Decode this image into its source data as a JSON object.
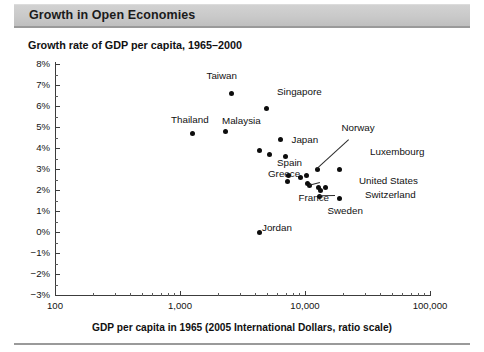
{
  "header": {
    "title": "Growth in Open Economies"
  },
  "chart_data": {
    "type": "scatter",
    "title": "Growth rate of GDP per capita, 1965–2000",
    "xlabel": "GDP per capita in 1965 (2005 International Dollars, ratio scale)",
    "ylabel": "",
    "xscale": "log",
    "xlim": [
      100,
      100000
    ],
    "ylim": [
      -3,
      8
    ],
    "grid": false,
    "legend": null,
    "xticks": [
      "100",
      "1,000",
      "10,000",
      "100,000"
    ],
    "xtick_values": [
      100,
      1000,
      10000,
      100000
    ],
    "yticks": [
      "8%",
      "7%",
      "6%",
      "5%",
      "4%",
      "3%",
      "2%",
      "1%",
      "0%",
      "−1%",
      "−2%",
      "−3%"
    ],
    "ytick_values": [
      8,
      7,
      6,
      5,
      4,
      3,
      2,
      1,
      0,
      -1,
      -2,
      -3
    ],
    "points": [
      {
        "name": "Taiwan",
        "x": 2600,
        "y": 6.6,
        "label": "Taiwan",
        "lx": 222,
        "ly": 76,
        "anchor": "center",
        "leader": false
      },
      {
        "name": "Singapore",
        "x": 4900,
        "y": 5.9,
        "label": "Singapore",
        "lx": 277,
        "ly": 92,
        "anchor": "left",
        "leader": false
      },
      {
        "name": "Thailand",
        "x": 1250,
        "y": 4.7,
        "label": "Thailand",
        "lx": 190,
        "ly": 120,
        "anchor": "center",
        "leader": false
      },
      {
        "name": "Malaysia",
        "x": 2300,
        "y": 4.8,
        "label": "Malaysia",
        "lx": 222,
        "ly": 121,
        "anchor": "left",
        "leader": false
      },
      {
        "name": "Unlabeled-1",
        "x": 6400,
        "y": 4.4,
        "label": "",
        "lx": 0,
        "ly": 0,
        "anchor": "left",
        "leader": false
      },
      {
        "name": "Japan",
        "x": 7000,
        "y": 3.6,
        "label": "Japan",
        "lx": 305,
        "ly": 140,
        "anchor": "center",
        "leader": false
      },
      {
        "name": "Unlabeled-2",
        "x": 4300,
        "y": 3.9,
        "label": "",
        "lx": 0,
        "ly": 0,
        "anchor": "left",
        "leader": false
      },
      {
        "name": "Unlabeled-3",
        "x": 5200,
        "y": 3.7,
        "label": "",
        "lx": 0,
        "ly": 0,
        "anchor": "left",
        "leader": false
      },
      {
        "name": "Norway",
        "x": 12500,
        "y": 3.0,
        "label": "Norway",
        "lx": 358,
        "ly": 128,
        "anchor": "center",
        "leader": true,
        "ltx": 349,
        "lty": 140
      },
      {
        "name": "Luxembourg",
        "x": 19000,
        "y": 3.0,
        "label": "Luxembourg",
        "lx": 370,
        "ly": 152,
        "anchor": "left",
        "leader": false
      },
      {
        "name": "Spain",
        "x": 7400,
        "y": 2.7,
        "label": "Spain",
        "lx": 302,
        "ly": 163,
        "anchor": "right",
        "leader": false
      },
      {
        "name": "Greece",
        "x": 7300,
        "y": 2.4,
        "label": "Greece",
        "lx": 300,
        "ly": 174,
        "anchor": "right",
        "leader": false
      },
      {
        "name": "Unlabeled-4",
        "x": 9200,
        "y": 2.6,
        "label": "",
        "lx": 0,
        "ly": 0,
        "anchor": "left",
        "leader": false
      },
      {
        "name": "Unlabeled-5",
        "x": 10200,
        "y": 2.7,
        "label": "",
        "lx": 0,
        "ly": 0,
        "anchor": "left",
        "leader": false
      },
      {
        "name": "Unlabeled-6",
        "x": 10500,
        "y": 2.3,
        "label": "",
        "lx": 0,
        "ly": 0,
        "anchor": "left",
        "leader": false
      },
      {
        "name": "France",
        "x": 10800,
        "y": 2.2,
        "label": "France",
        "lx": 314,
        "ly": 198,
        "anchor": "center",
        "leader": true,
        "ltx": 320,
        "lty": 183
      },
      {
        "name": "United States",
        "x": 14500,
        "y": 2.1,
        "label": "United States",
        "lx": 359,
        "ly": 181,
        "anchor": "left",
        "leader": false
      },
      {
        "name": "Unlabeled-7",
        "x": 12800,
        "y": 2.1,
        "label": "",
        "lx": 0,
        "ly": 0,
        "anchor": "left",
        "leader": false
      },
      {
        "name": "Unlabeled-8",
        "x": 13300,
        "y": 2.0,
        "label": "",
        "lx": 0,
        "ly": 0,
        "anchor": "left",
        "leader": false
      },
      {
        "name": "Sweden",
        "x": 13000,
        "y": 1.7,
        "label": "Sweden",
        "lx": 345,
        "ly": 211,
        "anchor": "center",
        "leader": true,
        "ltx": 335,
        "lty": 196
      },
      {
        "name": "Switzerland",
        "x": 19000,
        "y": 1.6,
        "label": "Switzerland",
        "lx": 365,
        "ly": 195,
        "anchor": "left",
        "leader": false
      },
      {
        "name": "Jordan",
        "x": 4300,
        "y": 0.0,
        "label": "Jordan",
        "lx": 262,
        "ly": 228,
        "anchor": "left",
        "leader": false
      }
    ]
  }
}
